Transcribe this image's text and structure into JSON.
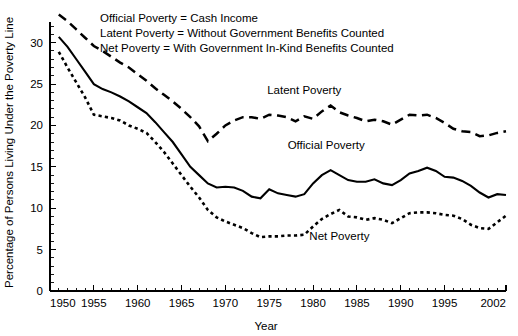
{
  "chart_data": {
    "type": "line",
    "title": "",
    "xlabel": "Year",
    "ylabel": "Percentage of Persons Living Under the Poverty Line",
    "xlim": [
      1950,
      2002
    ],
    "ylim": [
      0,
      32.5
    ],
    "grid": false,
    "legend_position": "inline-annotations",
    "x_ticks_major": [
      1950,
      1955,
      1960,
      1965,
      1970,
      1975,
      1980,
      1985,
      1990,
      1995,
      2002
    ],
    "x_tick_labels": [
      "1950",
      "1955",
      "1960",
      "1965",
      "1970",
      "1975",
      "1980",
      "1985",
      "1990",
      "1995",
      "2002"
    ],
    "x_minor_tick_interval": 1,
    "y_ticks_major": [
      0,
      5,
      10,
      15,
      20,
      25,
      30
    ],
    "y_tick_labels": [
      "0",
      "5",
      "10",
      "15",
      "20",
      "25",
      "30"
    ],
    "y_minor_tick_interval": 1,
    "annotations": [
      {
        "text": "Latent Poverty",
        "x": 1979.0,
        "y": 23.8
      },
      {
        "text": "Official Poverty",
        "x": 1981.5,
        "y": 17.2
      },
      {
        "text": "Net Poverty",
        "x": 1983.0,
        "y": 6.2
      }
    ],
    "legend_lines": [
      "Official Poverty = Cash Income",
      "Latent Poverty = Without Government Benefits Counted",
      "Net Poverty = With Government In-Kind Benefits Counted"
    ],
    "x": [
      1951,
      1952,
      1953,
      1954,
      1955,
      1956,
      1957,
      1958,
      1959,
      1960,
      1961,
      1962,
      1963,
      1964,
      1965,
      1966,
      1967,
      1968,
      1969,
      1970,
      1971,
      1972,
      1973,
      1974,
      1975,
      1976,
      1977,
      1978,
      1979,
      1980,
      1981,
      1982,
      1983,
      1984,
      1985,
      1986,
      1987,
      1988,
      1989,
      1990,
      1991,
      1992,
      1993,
      1994,
      1995,
      1996,
      1997,
      1998,
      1999,
      2000,
      2001,
      2002
    ],
    "series": [
      {
        "name": "Latent Poverty",
        "style": "long-dashed",
        "values": [
          33.4,
          32.6,
          31.6,
          30.6,
          29.6,
          29.0,
          28.3,
          27.6,
          27.0,
          26.2,
          25.4,
          24.5,
          23.7,
          22.9,
          22.0,
          21.0,
          19.9,
          18.1,
          19.0,
          20.0,
          20.6,
          21.0,
          21.0,
          20.8,
          21.3,
          21.2,
          21.0,
          20.5,
          21.1,
          20.8,
          21.7,
          22.4,
          21.6,
          21.2,
          20.9,
          20.5,
          20.7,
          20.5,
          20.1,
          20.7,
          21.3,
          21.2,
          21.3,
          20.9,
          20.3,
          19.6,
          19.3,
          19.2,
          18.7,
          18.8,
          19.1,
          19.3
        ]
      },
      {
        "name": "Official Poverty",
        "style": "solid",
        "values": [
          30.7,
          29.5,
          28.0,
          26.5,
          25.0,
          24.4,
          24.0,
          23.5,
          22.9,
          22.2,
          21.5,
          20.4,
          19.2,
          18.0,
          16.5,
          15.0,
          14.0,
          13.0,
          12.5,
          12.6,
          12.5,
          12.1,
          11.4,
          11.2,
          12.3,
          11.8,
          11.6,
          11.4,
          11.7,
          13.0,
          14.0,
          14.6,
          14.0,
          13.4,
          13.2,
          13.2,
          13.5,
          13.0,
          12.8,
          13.4,
          14.2,
          14.5,
          14.9,
          14.5,
          13.8,
          13.7,
          13.3,
          12.7,
          11.9,
          11.3,
          11.7,
          11.6
        ]
      },
      {
        "name": "Net Poverty",
        "style": "short-dashed",
        "values": [
          28.9,
          27.0,
          25.2,
          23.4,
          21.3,
          21.1,
          20.9,
          20.6,
          20.0,
          19.6,
          19.1,
          18.0,
          16.8,
          15.4,
          14.0,
          12.6,
          11.3,
          9.8,
          8.9,
          8.4,
          8.0,
          7.6,
          7.0,
          6.5,
          6.6,
          6.6,
          6.7,
          6.7,
          6.8,
          7.8,
          8.7,
          9.3,
          9.8,
          9.0,
          8.9,
          8.6,
          8.8,
          8.6,
          8.2,
          8.8,
          9.4,
          9.5,
          9.5,
          9.4,
          9.2,
          9.1,
          8.7,
          8.0,
          7.6,
          7.5,
          8.3,
          9.1
        ]
      }
    ]
  },
  "axis": {
    "x_title": "Year",
    "y_title": "Percentage of Persons Living Under the Poverty Line"
  }
}
